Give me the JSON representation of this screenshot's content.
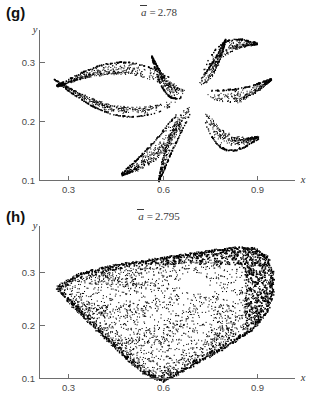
{
  "figure": {
    "kind": "scientific-figure",
    "background_color": "#ffffff",
    "point_color": "#000000",
    "axis_color": "#6e6e6e",
    "text_color": "#333333"
  },
  "panels": [
    {
      "id": "g",
      "label": "(g)",
      "title_symbol": "a",
      "title_relation": "=",
      "title_value": "2.78",
      "title_full": "ā = 2.78",
      "xlabel": "x",
      "ylabel": "y",
      "xticks": [
        0.3,
        0.6,
        0.9
      ],
      "xtick_labels": [
        "0.3",
        "0.6",
        "0.9"
      ],
      "yticks": [
        0.1,
        0.2,
        0.3
      ],
      "ytick_labels": [
        "0.1",
        "0.2",
        "0.3"
      ],
      "xlim": [
        0.22,
        0.99
      ],
      "ylim": [
        0.085,
        0.355
      ]
    },
    {
      "id": "h",
      "label": "(h)",
      "title_symbol": "a",
      "title_relation": "=",
      "title_value": "2.795",
      "title_full": "ā = 2.795",
      "xlabel": "x",
      "ylabel": "y",
      "xticks": [
        0.3,
        0.6,
        0.9
      ],
      "xtick_labels": [
        "0.3",
        "0.6",
        "0.9"
      ],
      "yticks": [
        0.1,
        0.2,
        0.3
      ],
      "ytick_labels": [
        "0.1",
        "0.2",
        "0.3"
      ],
      "xlim": [
        0.22,
        0.99
      ],
      "ylim": [
        0.06,
        0.355
      ]
    }
  ],
  "chart_data": [
    {
      "type": "scatter",
      "panel": "g",
      "title": "ā = 2.78",
      "xlabel": "x",
      "ylabel": "y",
      "xlim": [
        0.22,
        0.99
      ],
      "ylim": [
        0.085,
        0.355
      ],
      "xticks": [
        0.3,
        0.6,
        0.9
      ],
      "yticks": [
        0.1,
        0.2,
        0.3
      ],
      "grid": false,
      "legend": "none",
      "marker": "point",
      "marker_color": "#000000",
      "point_count": 2600,
      "structure": "eight disjoint wedge-shaped bands arranged as a pinwheel about a central hole; period-8 chaotic band attractor",
      "center": [
        0.695,
        0.245
      ],
      "hole_radius": 0.022,
      "lobes": [
        {
          "name": "west-upper-lens",
          "apex": [
            0.695,
            0.248
          ],
          "tip": [
            0.255,
            0.272
          ],
          "half_width": 0.016,
          "curvature": 0.035,
          "density": 0.16,
          "edge_bias": "upper"
        },
        {
          "name": "west-lower-lens",
          "apex": [
            0.695,
            0.243
          ],
          "tip": [
            0.262,
            0.258
          ],
          "half_width": 0.02,
          "curvature": -0.03,
          "density": 0.17,
          "edge_bias": "lower"
        },
        {
          "name": "south-west-wedge",
          "apex": [
            0.69,
            0.235
          ],
          "tip": [
            0.47,
            0.108
          ],
          "half_width": 0.03,
          "curvature": 0.03,
          "density": 0.14,
          "edge_bias": "lower"
        },
        {
          "name": "south-wedge",
          "apex": [
            0.7,
            0.238
          ],
          "tip": [
            0.585,
            0.1
          ],
          "half_width": 0.024,
          "curvature": -0.022,
          "density": 0.12,
          "edge_bias": "right"
        },
        {
          "name": "south-east-wedge",
          "apex": [
            0.71,
            0.24
          ],
          "tip": [
            0.905,
            0.175
          ],
          "half_width": 0.028,
          "curvature": -0.028,
          "density": 0.12,
          "edge_bias": "lower"
        },
        {
          "name": "east-wedge",
          "apex": [
            0.712,
            0.248
          ],
          "tip": [
            0.945,
            0.27
          ],
          "half_width": 0.022,
          "curvature": -0.026,
          "density": 0.11,
          "edge_bias": "upper"
        },
        {
          "name": "north-east-wedge",
          "apex": [
            0.706,
            0.252
          ],
          "tip": [
            0.9,
            0.33
          ],
          "half_width": 0.022,
          "curvature": 0.022,
          "density": 0.1,
          "edge_bias": "upper"
        },
        {
          "name": "north-wedge",
          "apex": [
            0.698,
            0.255
          ],
          "tip": [
            0.565,
            0.312
          ],
          "half_width": 0.022,
          "curvature": 0.02,
          "density": 0.12,
          "edge_bias": "upper"
        },
        {
          "name": "north-inner-wedge",
          "apex": [
            0.703,
            0.254
          ],
          "tip": [
            0.8,
            0.338
          ],
          "half_width": 0.018,
          "curvature": -0.018,
          "density": 0.08,
          "edge_bias": "upper"
        }
      ]
    },
    {
      "type": "scatter",
      "panel": "h",
      "title": "ā = 2.795",
      "xlabel": "x",
      "ylabel": "y",
      "xlim": [
        0.22,
        0.99
      ],
      "ylim": [
        0.06,
        0.355
      ],
      "xticks": [
        0.3,
        0.6,
        0.9
      ],
      "yticks": [
        0.1,
        0.2,
        0.3
      ],
      "grid": false,
      "legend": "none",
      "marker": "point",
      "marker_color": "#000000",
      "point_count": 3400,
      "structure": "single merged fan-shaped attractor; bands have joined into one connected region with dense upper-left edge, dense right rim and a small white hole near the centre",
      "outline": [
        [
          0.262,
          0.272
        ],
        [
          0.33,
          0.296
        ],
        [
          0.43,
          0.312
        ],
        [
          0.54,
          0.322
        ],
        [
          0.64,
          0.331
        ],
        [
          0.74,
          0.34
        ],
        [
          0.83,
          0.347
        ],
        [
          0.89,
          0.345
        ],
        [
          0.93,
          0.33
        ],
        [
          0.948,
          0.3
        ],
        [
          0.95,
          0.262
        ],
        [
          0.93,
          0.225
        ],
        [
          0.88,
          0.19
        ],
        [
          0.8,
          0.16
        ],
        [
          0.72,
          0.134
        ],
        [
          0.65,
          0.11
        ],
        [
          0.6,
          0.095
        ],
        [
          0.545,
          0.108
        ],
        [
          0.48,
          0.14
        ],
        [
          0.42,
          0.175
        ],
        [
          0.36,
          0.21
        ],
        [
          0.3,
          0.245
        ],
        [
          0.262,
          0.272
        ]
      ],
      "hole": {
        "center": [
          0.7,
          0.28
        ],
        "rx": 0.045,
        "ry": 0.02
      },
      "dense_edges": [
        "upper-left rim",
        "right rim",
        "lower arc",
        "top-right cap"
      ],
      "filaments_center": [
        0.7,
        0.278
      ]
    }
  ]
}
